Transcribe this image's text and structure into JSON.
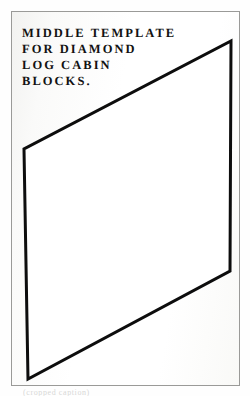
{
  "page": {
    "background_color": "#ffffff",
    "plate": {
      "border_color": "#9a9a98",
      "fill_color": "#f7f7f5"
    }
  },
  "caption": {
    "lines": [
      "MIDDLE TEMPLATE",
      "FOR DIAMOND",
      "LOG CABIN",
      "BLOCKS."
    ],
    "text_color": "#121212"
  },
  "diagram": {
    "name": "diamond-log-cabin-middle-template",
    "shape": "parallelogram",
    "stroke_color": "#0d0d0d",
    "fill_color": "#ffffff",
    "stroke_width": 3,
    "vertices": [
      {
        "label": "top-right",
        "x": 219,
        "y": 29
      },
      {
        "label": "right",
        "x": 218,
        "y": 259
      },
      {
        "label": "bottom-left",
        "x": 16,
        "y": 367
      },
      {
        "label": "left",
        "x": 12,
        "y": 137
      }
    ],
    "points_attr": "219,29 218,259 16,367 12,137"
  },
  "undertext": {
    "line": "(cropped caption)"
  }
}
